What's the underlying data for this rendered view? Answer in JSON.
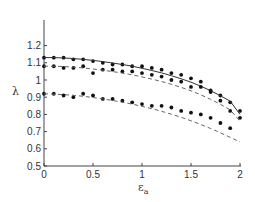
{
  "chart_data": {
    "type": "line",
    "title": "",
    "xlabel": "ε_a",
    "ylabel": "λ",
    "xlim": [
      0,
      2
    ],
    "ylim": [
      0.5,
      1.3
    ],
    "xticks": [
      "0",
      "0.5",
      "1",
      "1.5",
      "2"
    ],
    "yticks": [
      "0.5",
      "0.6",
      "0.7",
      "0.8",
      "0.9",
      "1",
      "1.1",
      "1.2"
    ],
    "grid": false,
    "legend": null,
    "x": [
      0,
      0.1,
      0.2,
      0.3,
      0.4,
      0.5,
      0.6,
      0.7,
      0.8,
      0.9,
      1.0,
      1.1,
      1.2,
      1.3,
      1.4,
      1.5,
      1.6,
      1.7,
      1.8,
      1.9,
      2.0
    ],
    "series": [
      {
        "name": "upper-points",
        "style": "markers",
        "values": [
          1.13,
          1.13,
          1.13,
          1.12,
          1.12,
          1.11,
          1.1,
          1.09,
          1.09,
          1.08,
          1.08,
          1.07,
          1.06,
          1.04,
          1.03,
          1.01,
          0.99,
          0.94,
          0.91,
          0.87,
          0.82
        ]
      },
      {
        "name": "upper-fit",
        "style": "solid",
        "values": [
          1.13,
          1.13,
          1.128,
          1.125,
          1.12,
          1.114,
          1.107,
          1.099,
          1.09,
          1.08,
          1.068,
          1.055,
          1.041,
          1.025,
          1.007,
          0.987,
          0.964,
          0.938,
          0.909,
          0.877,
          0.8
        ]
      },
      {
        "name": "middle-points",
        "style": "markers",
        "values": [
          1.08,
          1.08,
          1.07,
          1.07,
          1.08,
          1.04,
          1.06,
          1.06,
          1.05,
          1.05,
          1.04,
          1.03,
          1.02,
          1.0,
          0.99,
          0.96,
          0.96,
          0.93,
          0.88,
          0.82,
          0.78
        ]
      },
      {
        "name": "middle-fit",
        "style": "dashed",
        "values": [
          1.08,
          1.08,
          1.078,
          1.075,
          1.07,
          1.064,
          1.057,
          1.049,
          1.04,
          1.03,
          1.018,
          1.005,
          0.991,
          0.975,
          0.957,
          0.937,
          0.914,
          0.888,
          0.859,
          0.827,
          0.76
        ]
      },
      {
        "name": "lower-points",
        "style": "markers",
        "values": [
          0.92,
          0.92,
          0.91,
          0.9,
          0.92,
          0.91,
          0.89,
          0.89,
          0.88,
          0.87,
          0.86,
          0.85,
          0.85,
          0.84,
          0.82,
          0.81,
          0.8,
          0.78,
          0.75,
          0.72,
          null
        ]
      },
      {
        "name": "lower-fit",
        "style": "dashed",
        "values": [
          0.92,
          0.918,
          0.915,
          0.911,
          0.905,
          0.898,
          0.89,
          0.881,
          0.871,
          0.86,
          0.847,
          0.833,
          0.818,
          0.801,
          0.783,
          0.763,
          0.741,
          0.718,
          0.693,
          0.666,
          0.64
        ]
      }
    ]
  }
}
